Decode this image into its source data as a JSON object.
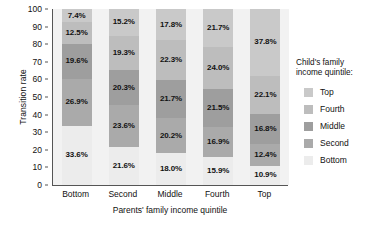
{
  "chart_data": {
    "type": "bar",
    "stacked": true,
    "stack_mode": "percent",
    "title": "",
    "xlabel": "Parents' family income quintile",
    "ylabel": "Transition rate",
    "ylim": [
      0,
      100
    ],
    "yticks": [
      0,
      10,
      20,
      30,
      40,
      50,
      60,
      70,
      80,
      90,
      100
    ],
    "grid": false,
    "legend_position": "right",
    "legend_title": "Child's family\nincome quintile:",
    "categories": [
      "Bottom",
      "Second",
      "Middle",
      "Fourth",
      "Top"
    ],
    "series": [
      {
        "name": "Top",
        "color": "#c9c9c9",
        "values": [
          7.4,
          15.2,
          17.8,
          21.7,
          37.8
        ],
        "labels": [
          "7.4%",
          "15.2%",
          "17.8%",
          "21.7%",
          "37.8%"
        ]
      },
      {
        "name": "Fourth",
        "color": "#bdbdbd",
        "values": [
          12.5,
          19.3,
          22.3,
          24.0,
          22.1
        ],
        "labels": [
          "12.5%",
          "19.3%",
          "22.3%",
          "24.0%",
          "22.1%"
        ]
      },
      {
        "name": "Middle",
        "color": "#9e9e9e",
        "values": [
          19.6,
          20.3,
          21.7,
          21.5,
          16.8
        ],
        "labels": [
          "19.6%",
          "20.3%",
          "21.7%",
          "21.5%",
          "16.8%"
        ]
      },
      {
        "name": "Second",
        "color": "#aaaaaa",
        "values": [
          26.9,
          23.6,
          20.2,
          16.9,
          12.4
        ],
        "labels": [
          "26.9%",
          "23.6%",
          "20.2%",
          "16.9%",
          "12.4%"
        ]
      },
      {
        "name": "Bottom",
        "color": "#ececec",
        "values": [
          33.6,
          21.6,
          18.0,
          15.9,
          10.9
        ],
        "labels": [
          "33.6%",
          "21.6%",
          "18.0%",
          "15.9%",
          "10.9%"
        ]
      }
    ]
  },
  "axes": {
    "y_title": "Transition rate",
    "x_title": "Parents' family income quintile",
    "y_ticks": [
      "100",
      "90",
      "80",
      "70",
      "60",
      "50",
      "40",
      "30",
      "20",
      "10",
      "0"
    ],
    "x_ticks": [
      "Bottom",
      "Second",
      "Middle",
      "Fourth",
      "Top"
    ]
  },
  "legend": {
    "title": "Child's family\nincome quintile:",
    "items": [
      {
        "label": "Top",
        "color": "#c9c9c9"
      },
      {
        "label": "Fourth",
        "color": "#bdbdbd"
      },
      {
        "label": "Middle",
        "color": "#9e9e9e"
      },
      {
        "label": "Second",
        "color": "#aaaaaa"
      },
      {
        "label": "Bottom",
        "color": "#ececec"
      }
    ]
  },
  "style": {
    "plot_background": "#f2f2f2",
    "page_background": "#ffffff",
    "axis_color": "#555555",
    "text_color": "#111111"
  }
}
